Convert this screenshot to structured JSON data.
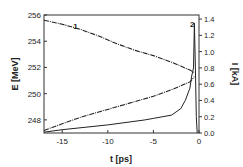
{
  "chart_data": {
    "type": "line",
    "title": "",
    "xlabel": "t  [ps]",
    "ylabel": "E  [MeV]",
    "y2label": "I  [kA]",
    "xlim": [
      -17,
      0
    ],
    "ylim": [
      247,
      256
    ],
    "y2lim": [
      0,
      1.45
    ],
    "xticks": [
      -15,
      -10,
      -5,
      0
    ],
    "yticks": [
      248,
      250,
      252,
      254,
      256
    ],
    "y2ticks": [
      "0.0",
      "0.2",
      "0.4",
      "0.6",
      "0.8",
      "1.0",
      "1.2",
      "1.4"
    ],
    "grid": false,
    "annotations": [
      {
        "text": "1",
        "x": -13.8,
        "y": 254.9
      },
      {
        "text": "2",
        "x": -1.0,
        "y": 255.1
      }
    ],
    "series": [
      {
        "name": "Energy upper branch (1)",
        "axis": "left",
        "style": "dash-dot",
        "x": [
          -17,
          -15,
          -13,
          -11,
          -9,
          -7,
          -5,
          -3,
          -2,
          -1,
          -0.5
        ],
        "y": [
          255.6,
          255.3,
          254.9,
          254.4,
          253.8,
          253.3,
          252.9,
          252.4,
          252.1,
          251.8,
          251.6
        ]
      },
      {
        "name": "Energy lower branch",
        "axis": "left",
        "style": "dash-dot",
        "x": [
          -17,
          -15,
          -13,
          -11,
          -9,
          -7,
          -5,
          -3,
          -2,
          -1,
          -0.5
        ],
        "y": [
          247.2,
          247.7,
          248.2,
          248.6,
          249.0,
          249.4,
          249.8,
          250.3,
          250.6,
          250.9,
          251.3
        ]
      },
      {
        "name": "Current (2)",
        "axis": "right",
        "style": "solid",
        "x": [
          -17,
          -15,
          -10,
          -6,
          -5,
          -3,
          -2,
          -1.5,
          -1,
          -0.8,
          -0.6,
          -0.5,
          -0.4,
          -0.3,
          -0.2
        ],
        "y": [
          0.01,
          0.04,
          0.1,
          0.16,
          0.18,
          0.22,
          0.3,
          0.4,
          0.55,
          0.7,
          0.8,
          1.35,
          0.8,
          0.2,
          0.0
        ]
      }
    ]
  }
}
